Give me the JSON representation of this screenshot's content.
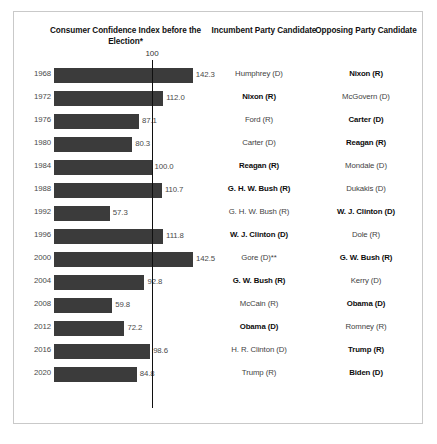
{
  "headers": {
    "chart_title": "Consumer Confidence Index before the Election*",
    "incumbent": "Incumbent Party Candidate",
    "opposing": "Opposing Party Candidate",
    "axis_tick": "100"
  },
  "chart_data": {
    "type": "bar",
    "title": "Consumer Confidence Index before the Election*",
    "xlabel": "",
    "ylabel": "",
    "orientation": "horizontal",
    "grid": false,
    "legend": null,
    "reference_line": 100,
    "reference_line_label": "100",
    "xlim": [
      0,
      150
    ],
    "categories": [
      "1968",
      "1972",
      "1976",
      "1980",
      "1984",
      "1988",
      "1992",
      "1996",
      "2000",
      "2004",
      "2008",
      "2012",
      "2016",
      "2020"
    ],
    "values": [
      142.3,
      112.0,
      87.1,
      80.3,
      100.0,
      110.7,
      57.3,
      111.8,
      142.5,
      92.8,
      59.8,
      72.2,
      98.6,
      84.8
    ],
    "value_labels": [
      "142.3",
      "112.0",
      "87.1",
      "80.3",
      "100.0",
      "110.7",
      "57.3",
      "111.8",
      "142.5",
      "92.8",
      "59.8",
      "72.2",
      "98.6",
      "84.8"
    ],
    "bar_color": "#3b3b3b",
    "annotations": [
      "*",
      "**"
    ]
  },
  "rows": [
    {
      "year": "1968",
      "value": 142.3,
      "value_label": "142.3",
      "incumbent": "Humphrey (D)",
      "opposing": "Nixon (R)",
      "winner": "opposing"
    },
    {
      "year": "1972",
      "value": 112.0,
      "value_label": "112.0",
      "incumbent": "Nixon (R)",
      "opposing": "McGovern (D)",
      "winner": "incumbent"
    },
    {
      "year": "1976",
      "value": 87.1,
      "value_label": "87.1",
      "incumbent": "Ford (R)",
      "opposing": "Carter (D)",
      "winner": "opposing"
    },
    {
      "year": "1980",
      "value": 80.3,
      "value_label": "80.3",
      "incumbent": "Carter (D)",
      "opposing": "Reagan (R)",
      "winner": "opposing"
    },
    {
      "year": "1984",
      "value": 100.0,
      "value_label": "100.0",
      "incumbent": "Reagan (R)",
      "opposing": "Mondale (D)",
      "winner": "incumbent"
    },
    {
      "year": "1988",
      "value": 110.7,
      "value_label": "110.7",
      "incumbent": "G. H. W. Bush (R)",
      "opposing": "Dukakis (D)",
      "winner": "incumbent"
    },
    {
      "year": "1992",
      "value": 57.3,
      "value_label": "57.3",
      "incumbent": "G. H. W. Bush (R)",
      "opposing": "W. J. Clinton (D)",
      "winner": "opposing"
    },
    {
      "year": "1996",
      "value": 111.8,
      "value_label": "111.8",
      "incumbent": "W. J. Clinton (D)",
      "opposing": "Dole (R)",
      "winner": "incumbent"
    },
    {
      "year": "2000",
      "value": 142.5,
      "value_label": "142.5",
      "incumbent": "Gore (D)**",
      "opposing": "G. W. Bush (R)",
      "winner": "opposing"
    },
    {
      "year": "2004",
      "value": 92.8,
      "value_label": "92.8",
      "incumbent": "G. W. Bush (R)",
      "opposing": "Kerry (D)",
      "winner": "incumbent"
    },
    {
      "year": "2008",
      "value": 59.8,
      "value_label": "59.8",
      "incumbent": "McCain (R)",
      "opposing": "Obama (D)",
      "winner": "opposing"
    },
    {
      "year": "2012",
      "value": 72.2,
      "value_label": "72.2",
      "incumbent": "Obama (D)",
      "opposing": "Romney (R)",
      "winner": "incumbent"
    },
    {
      "year": "2016",
      "value": 98.6,
      "value_label": "98.6",
      "incumbent": "H. R. Clinton (D)",
      "opposing": "Trump (R)",
      "winner": "opposing"
    },
    {
      "year": "2020",
      "value": 84.8,
      "value_label": "84.8",
      "incumbent": "Trump (R)",
      "opposing": "Biden (D)",
      "winner": "opposing"
    }
  ]
}
